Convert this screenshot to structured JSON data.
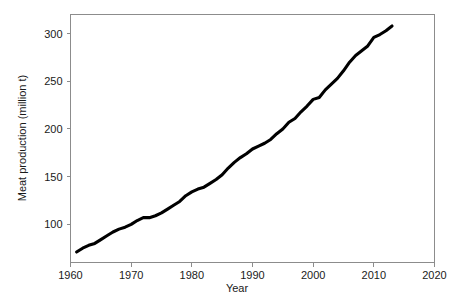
{
  "chart_data": {
    "type": "line",
    "title": "",
    "xlabel": "Year",
    "ylabel": "Meat production (million t)",
    "xlim": [
      1960,
      2020
    ],
    "ylim": [
      60,
      320
    ],
    "xticks": [
      1960,
      1970,
      1980,
      1990,
      2000,
      2010,
      2020
    ],
    "xticklabels": [
      "1960",
      "1970",
      "1980",
      "1990",
      "2000",
      "2010",
      "2020"
    ],
    "yticks": [
      100,
      150,
      200,
      250,
      300
    ],
    "yticklabels": [
      "100",
      "150",
      "200",
      "250",
      "300"
    ],
    "grid": false,
    "legend": null,
    "series": [
      {
        "name": "Meat production",
        "color": "#000000",
        "x": [
          1961,
          1962,
          1963,
          1964,
          1965,
          1966,
          1967,
          1968,
          1969,
          1970,
          1971,
          1972,
          1973,
          1974,
          1975,
          1976,
          1977,
          1978,
          1979,
          1980,
          1981,
          1982,
          1983,
          1984,
          1985,
          1986,
          1987,
          1988,
          1989,
          1990,
          1991,
          1992,
          1993,
          1994,
          1995,
          1996,
          1997,
          1998,
          1999,
          2000,
          2001,
          2002,
          2003,
          2004,
          2005,
          2006,
          2007,
          2008,
          2009,
          2010,
          2011,
          2012,
          2013
        ],
        "values": [
          71,
          75,
          78,
          80,
          84,
          88,
          92,
          95,
          97,
          100,
          104,
          107,
          107,
          109,
          112,
          116,
          120,
          124,
          130,
          134,
          137,
          139,
          143,
          147,
          152,
          159,
          165,
          170,
          174,
          179,
          182,
          185,
          189,
          195,
          200,
          207,
          211,
          218,
          224,
          231,
          233,
          241,
          247,
          253,
          261,
          270,
          277,
          282,
          287,
          296,
          299,
          303,
          308
        ]
      }
    ]
  },
  "axes": {
    "x_title": "Year",
    "y_title": "Meat production (million t)"
  }
}
